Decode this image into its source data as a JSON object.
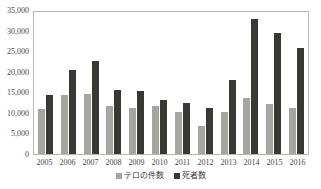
{
  "chart_data": {
    "type": "bar",
    "title": "",
    "xlabel": "",
    "ylabel": "",
    "ylim": [
      0,
      35000
    ],
    "ytick_step": 5000,
    "ytick_labels": [
      "35,000",
      "30,000",
      "25,000",
      "20,000",
      "15,000",
      "10,000",
      "5,000",
      "0"
    ],
    "ytick_values": [
      35000,
      30000,
      25000,
      20000,
      15000,
      10000,
      5000,
      0
    ],
    "grid": false,
    "legend_position": "bottom",
    "categories": [
      "2005",
      "2006",
      "2007",
      "2008",
      "2009",
      "2010",
      "2011",
      "2012",
      "2013",
      "2014",
      "2015",
      "2016"
    ],
    "series": [
      {
        "name": "テロの件数",
        "color": "#a6a5a0",
        "values": [
          11000,
          14300,
          14500,
          11700,
          11100,
          11600,
          10300,
          6800,
          10100,
          13500,
          12200,
          11200
        ]
      },
      {
        "name": "死者数",
        "color": "#3a3833",
        "values": [
          14400,
          20500,
          22700,
          15600,
          15200,
          13200,
          12500,
          11200,
          18100,
          32900,
          29500,
          25700
        ]
      }
    ]
  },
  "legend": {
    "items": [
      {
        "label": "テロの件数",
        "color": "#a6a5a0"
      },
      {
        "label": "死者数",
        "color": "#3a3833"
      }
    ]
  },
  "colors": {
    "incidents": "#a6a5a0",
    "deaths": "#3a3833",
    "axis": "#b9b7b2",
    "text": "#4a4843",
    "background": "#ffffff"
  }
}
